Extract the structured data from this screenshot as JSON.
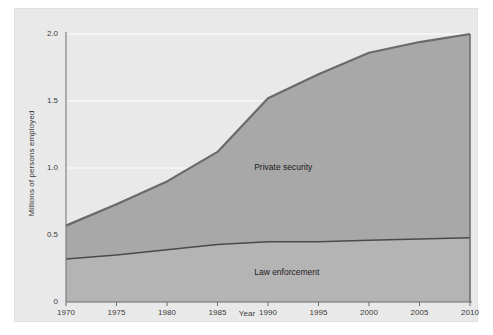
{
  "chart_data": {
    "type": "area",
    "title": "",
    "subtitle": "",
    "xlabel": "Year",
    "ylabel": "Millions of persons employed",
    "xlim": [
      1970,
      2010
    ],
    "ylim": [
      0,
      2.0
    ],
    "grid": true,
    "legend_position": "inline-annotations",
    "stacked": false,
    "x": [
      1970,
      1975,
      1980,
      1985,
      1990,
      1995,
      2000,
      2005,
      2010
    ],
    "xtick_labels": [
      "1970",
      "1975",
      "1980",
      "1985",
      "1990",
      "1995",
      "2000",
      "2005",
      "2010"
    ],
    "ytick_labels": [
      "0",
      "0.5",
      "1.0",
      "1.5",
      "2.0"
    ],
    "ytick_values": [
      0,
      0.5,
      1.0,
      1.5,
      2.0
    ],
    "series": [
      {
        "name": "Private security",
        "values": [
          0.57,
          0.73,
          0.9,
          1.12,
          1.52,
          1.7,
          1.86,
          1.94,
          2.0
        ],
        "annotation": "Private security",
        "fill_color": "#a8a8a8",
        "line_color": "#6a6a6a"
      },
      {
        "name": "Law enforcement",
        "values": [
          0.32,
          0.35,
          0.39,
          0.43,
          0.45,
          0.45,
          0.46,
          0.47,
          0.48
        ],
        "annotation": "Law enforcement",
        "fill_color": "#b4b4b4",
        "line_color": "#4a4a4a"
      }
    ],
    "annotations": [
      {
        "text": "Private security",
        "x": 1992,
        "y": 1.0
      },
      {
        "text": "Law enforcement",
        "x": 1992,
        "y": 0.22
      }
    ]
  },
  "colors": {
    "panel_background": "#e9e9e9",
    "page_background": "#ffffff",
    "axis": "#6e6e6e",
    "gridline": "#f4f4f4",
    "text": "#3a3a3a"
  }
}
